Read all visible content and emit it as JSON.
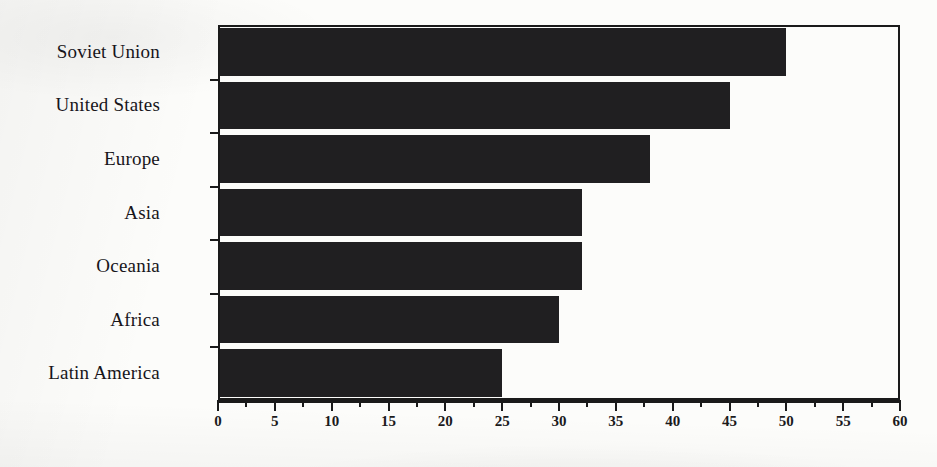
{
  "chart_data": {
    "type": "bar",
    "orientation": "horizontal",
    "title": "",
    "subtitle": "",
    "xlabel": "",
    "ylabel": "",
    "xlim": [
      0,
      60
    ],
    "ylim": null,
    "grid": false,
    "legend": null,
    "bar_color": "#201f21",
    "axis_color": "#1a1a1a",
    "background_color": "#fcfcfa",
    "categories": [
      "Soviet Union",
      "United States",
      "Europe",
      "Asia",
      "Oceania",
      "Africa",
      "Latin America"
    ],
    "values": [
      50,
      45,
      38,
      32,
      32,
      30,
      25
    ],
    "xticks": [
      0,
      5,
      10,
      15,
      20,
      25,
      30,
      35,
      40,
      45,
      50,
      55,
      60
    ],
    "xtick_labels": [
      "0",
      "5",
      "10",
      "15",
      "20",
      "25",
      "30",
      "35",
      "40",
      "45",
      "50",
      "55",
      "60"
    ],
    "minor_tick_interval": 2.5,
    "annotations": []
  }
}
